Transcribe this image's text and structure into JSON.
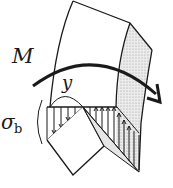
{
  "figure": {
    "labels": {
      "moment": "M",
      "distance": "y",
      "stress_symbol": "σ",
      "stress_subscript": "b"
    },
    "colors": {
      "stroke": "#1a1a1a",
      "shade": "#d9d9d9",
      "background": "#ffffff"
    }
  }
}
